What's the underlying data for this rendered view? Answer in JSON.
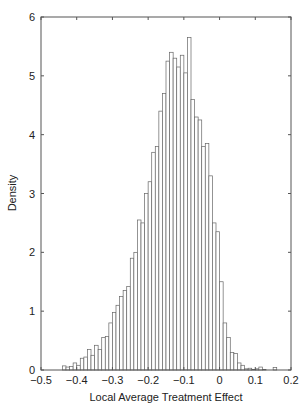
{
  "chart_data": {
    "type": "bar",
    "title": "",
    "xlabel": "Local Average Treatment Effect",
    "ylabel": "Density",
    "xlim": [
      -0.5,
      0.2
    ],
    "ylim": [
      0,
      6
    ],
    "xticks": [
      -0.5,
      -0.4,
      -0.3,
      -0.2,
      -0.1,
      0,
      0.1,
      0.2
    ],
    "xtick_labels": [
      "−0.5",
      "−0.4",
      "−0.3",
      "−0.2",
      "−0.1",
      "0",
      "0.1",
      "0.2"
    ],
    "yticks": [
      0,
      1,
      2,
      3,
      4,
      5,
      6
    ],
    "ytick_labels": [
      "0",
      "1",
      "2",
      "3",
      "4",
      "5",
      "6"
    ],
    "grid": false,
    "legend": null,
    "bin_width": 0.01,
    "bin_starts": [
      -0.44,
      -0.43,
      -0.42,
      -0.41,
      -0.4,
      -0.39,
      -0.38,
      -0.37,
      -0.36,
      -0.35,
      -0.34,
      -0.33,
      -0.32,
      -0.31,
      -0.3,
      -0.29,
      -0.28,
      -0.27,
      -0.26,
      -0.25,
      -0.24,
      -0.23,
      -0.22,
      -0.21,
      -0.2,
      -0.19,
      -0.18,
      -0.17,
      -0.16,
      -0.15,
      -0.14,
      -0.13,
      -0.12,
      -0.11,
      -0.1,
      -0.09,
      -0.08,
      -0.07,
      -0.06,
      -0.05,
      -0.04,
      -0.03,
      -0.02,
      -0.01,
      0.0,
      0.01,
      0.02,
      0.03,
      0.04,
      0.05,
      0.06,
      0.07,
      0.08,
      0.09,
      0.1,
      0.11,
      0.12,
      0.13,
      0.14,
      0.15
    ],
    "values": [
      0.07,
      0.05,
      0.06,
      0.12,
      0.08,
      0.2,
      0.22,
      0.35,
      0.25,
      0.42,
      0.35,
      0.55,
      0.57,
      0.8,
      0.98,
      1.1,
      1.25,
      1.35,
      1.42,
      1.9,
      2.0,
      2.55,
      2.5,
      3.0,
      3.2,
      3.7,
      3.8,
      4.4,
      4.7,
      5.25,
      5.4,
      5.3,
      5.15,
      5.35,
      5.05,
      5.65,
      4.6,
      4.3,
      4.25,
      3.8,
      3.85,
      3.3,
      2.5,
      2.35,
      1.5,
      0.8,
      0.55,
      0.3,
      0.28,
      0.12,
      0.08,
      0.02,
      0.03,
      0.01,
      0.02,
      0.05,
      0.01,
      0.0,
      0.0,
      0.04
    ]
  }
}
